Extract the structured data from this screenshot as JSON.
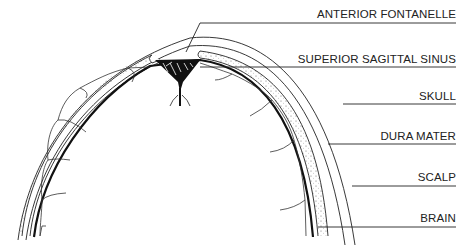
{
  "diagram": {
    "colors": {
      "ink": "#1a1a1a",
      "background": "#ffffff"
    },
    "labels": [
      {
        "id": "anterior-fontanelle",
        "text": "ANTERIOR FONTANELLE",
        "top": 9
      },
      {
        "id": "superior-sagittal-sinus",
        "text": "SUPERIOR SAGITTAL SINUS",
        "top": 54
      },
      {
        "id": "skull",
        "text": "SKULL",
        "top": 91
      },
      {
        "id": "dura-mater",
        "text": "DURA MATER",
        "top": 131
      },
      {
        "id": "scalp",
        "text": "SCALP",
        "top": 172
      },
      {
        "id": "brain",
        "text": "BRAIN",
        "top": 213
      }
    ]
  }
}
